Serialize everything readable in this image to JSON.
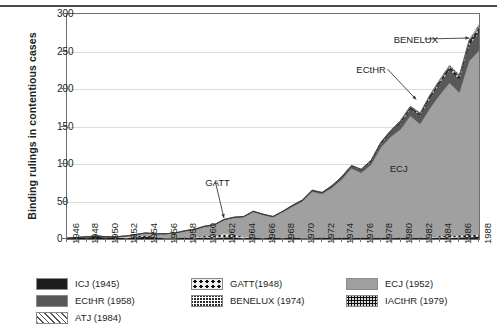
{
  "chart_data": {
    "type": "area",
    "stacked": true,
    "title": "",
    "xlabel": "",
    "ylabel": "Binding rulings in contentious cases",
    "ylim": [
      0,
      300
    ],
    "yticks": [
      0,
      50,
      100,
      150,
      200,
      250,
      300
    ],
    "grid": true,
    "legend_position": "bottom",
    "x": [
      1946,
      1947,
      1948,
      1949,
      1950,
      1951,
      1952,
      1953,
      1954,
      1955,
      1956,
      1957,
      1958,
      1959,
      1960,
      1961,
      1962,
      1963,
      1964,
      1965,
      1966,
      1967,
      1968,
      1969,
      1970,
      1971,
      1972,
      1973,
      1974,
      1975,
      1976,
      1977,
      1978,
      1979,
      1980,
      1981,
      1982,
      1983,
      1984,
      1985,
      1986,
      1987,
      1988
    ],
    "xtick_labels": [
      "1946",
      "1948",
      "1950",
      "1952",
      "1954",
      "1956",
      "1958",
      "1960",
      "1962",
      "1964",
      "1966",
      "1968",
      "1970",
      "1972",
      "1974",
      "1976",
      "1978",
      "1980",
      "1982",
      "1984",
      "1986",
      "1988"
    ],
    "xtick_step_years": 2,
    "series": [
      {
        "name": "ICJ (1945)",
        "key": "ICJ",
        "color": "#1c1c1c",
        "pattern": "solid",
        "values": [
          1,
          2,
          2,
          3,
          2,
          2,
          1,
          2,
          3,
          2,
          1,
          1,
          2,
          1,
          2,
          1,
          2,
          2,
          1,
          2,
          1,
          2,
          1,
          2,
          1,
          1,
          2,
          1,
          2,
          1,
          2,
          1,
          2,
          1,
          2,
          1,
          2,
          1,
          2,
          1,
          2,
          2,
          3
        ]
      },
      {
        "name": "GATT(1948)",
        "key": "GATT",
        "color": "#efefef",
        "pattern": "large-dots",
        "values": [
          0,
          0,
          1,
          1,
          1,
          1,
          2,
          2,
          2,
          1,
          1,
          1,
          1,
          2,
          2,
          3,
          5,
          4,
          2,
          1,
          1,
          1,
          1,
          1,
          1,
          1,
          1,
          1,
          1,
          1,
          1,
          1,
          1,
          1,
          1,
          1,
          1,
          2,
          2,
          3,
          3,
          3,
          3
        ]
      },
      {
        "name": "ECJ (1952)",
        "key": "ECJ",
        "color": "#a0a0a0",
        "pattern": "solid",
        "values": [
          0,
          0,
          0,
          0,
          0,
          0,
          1,
          2,
          3,
          4,
          5,
          6,
          7,
          9,
          12,
          14,
          18,
          22,
          26,
          33,
          30,
          26,
          34,
          40,
          48,
          61,
          57,
          66,
          76,
          92,
          85,
          97,
          119,
          134,
          143,
          162,
          150,
          171,
          188,
          204,
          190,
          232,
          245
        ]
      },
      {
        "name": "ECtHR (1958)",
        "key": "ECtHR",
        "color": "#585858",
        "pattern": "solid",
        "values": [
          0,
          0,
          0,
          0,
          0,
          0,
          0,
          0,
          0,
          0,
          0,
          0,
          1,
          1,
          1,
          1,
          1,
          1,
          1,
          1,
          1,
          1,
          1,
          2,
          2,
          2,
          2,
          3,
          3,
          3,
          4,
          4,
          5,
          6,
          8,
          9,
          11,
          13,
          15,
          17,
          17,
          21,
          24
        ]
      },
      {
        "name": "BENELUX (1974)",
        "key": "BENELUX",
        "color": "#2b2b2b",
        "pattern": "fine-checker",
        "values": [
          0,
          0,
          0,
          0,
          0,
          0,
          0,
          0,
          0,
          0,
          0,
          0,
          0,
          0,
          0,
          0,
          0,
          0,
          0,
          0,
          0,
          0,
          0,
          0,
          0,
          0,
          0,
          0,
          1,
          1,
          1,
          2,
          2,
          2,
          3,
          3,
          3,
          4,
          4,
          5,
          5,
          6,
          7
        ]
      },
      {
        "name": "IACtHR (1979)",
        "key": "IACtHR",
        "color": "#d8d8d8",
        "pattern": "speckle",
        "values": [
          0,
          0,
          0,
          0,
          0,
          0,
          0,
          0,
          0,
          0,
          0,
          0,
          0,
          0,
          0,
          0,
          0,
          0,
          0,
          0,
          0,
          0,
          0,
          0,
          0,
          0,
          0,
          0,
          0,
          0,
          0,
          0,
          0,
          1,
          1,
          1,
          1,
          1,
          1,
          1,
          1,
          1,
          2
        ]
      },
      {
        "name": "ATJ (1984)",
        "key": "ATJ",
        "color": "#ffffff",
        "pattern": "diagonal-hatch",
        "values": [
          0,
          0,
          0,
          0,
          0,
          0,
          0,
          0,
          0,
          0,
          0,
          0,
          0,
          0,
          0,
          0,
          0,
          0,
          0,
          0,
          0,
          0,
          0,
          0,
          0,
          0,
          0,
          0,
          0,
          0,
          0,
          0,
          0,
          0,
          0,
          0,
          0,
          0,
          1,
          1,
          1,
          1,
          2
        ]
      }
    ],
    "annotations": [
      {
        "label": "GATT",
        "x_year": 1962,
        "y_value": 28,
        "text_x_year": 1960.2,
        "text_y_value": 82
      },
      {
        "label": "ECtHR",
        "x_year": 1981.6,
        "y_value": 186,
        "text_x_year": 1975.6,
        "text_y_value": 232
      },
      {
        "label": "BENELUX",
        "x_year": 1987.0,
        "y_value": 268,
        "text_x_year": 1979.4,
        "text_y_value": 272
      },
      {
        "label": "ECJ",
        "x_year": 1979.0,
        "y_value": 100,
        "text_x_year": 1979.0,
        "text_y_value": 100,
        "inline": true
      }
    ]
  },
  "legend": {
    "columns": [
      {
        "items": [
          {
            "label": "ICJ (1945)",
            "swatch": "sw-icj"
          },
          {
            "label": "ECtHR (1958)",
            "swatch": "sw-ecthr"
          },
          {
            "label": "ATJ (1984)",
            "swatch": "sw-atj"
          }
        ]
      },
      {
        "items": [
          {
            "label": "GATT(1948)",
            "swatch": "sw-gatt"
          },
          {
            "label": "BENELUX (1974)",
            "swatch": "sw-benelux"
          }
        ]
      },
      {
        "items": [
          {
            "label": "ECJ (1952)",
            "swatch": "sw-ecj"
          },
          {
            "label": "IACtHR (1979)",
            "swatch": "sw-iacthr"
          }
        ]
      }
    ]
  }
}
